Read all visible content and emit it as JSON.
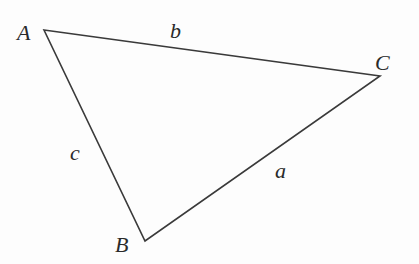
{
  "diagram": {
    "type": "triangle",
    "stroke_color": "#3a3a3a",
    "vertices": [
      {
        "label": "A",
        "x": 44,
        "y": 30,
        "lx": 17,
        "ly": 40
      },
      {
        "label": "B",
        "x": 145,
        "y": 241,
        "lx": 115,
        "ly": 252
      },
      {
        "label": "C",
        "x": 380,
        "y": 76,
        "lx": 375,
        "ly": 70
      }
    ],
    "sides": [
      {
        "label": "b",
        "lx": 170,
        "ly": 38
      },
      {
        "label": "a",
        "lx": 275,
        "ly": 178
      },
      {
        "label": "c",
        "lx": 70,
        "ly": 160
      }
    ]
  }
}
